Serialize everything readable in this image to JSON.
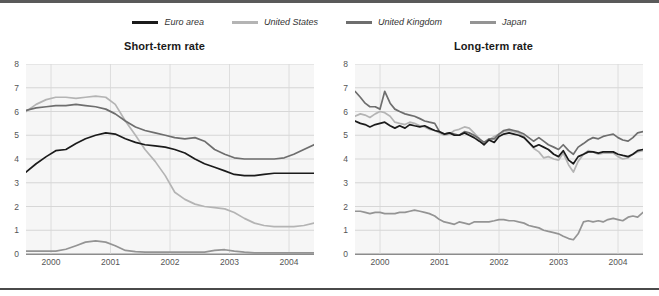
{
  "legend": {
    "items": [
      {
        "label": "Euro area",
        "color": "#1b1b1b",
        "icon": "line-swatch-icon"
      },
      {
        "label": "United States",
        "color": "#b4b4b4",
        "icon": "line-swatch-icon"
      },
      {
        "label": "United Kingdom",
        "color": "#6e6e6e",
        "icon": "line-swatch-icon"
      },
      {
        "label": "Japan",
        "color": "#949494",
        "icon": "line-swatch-icon"
      }
    ]
  },
  "panels": [
    {
      "title": "Short-term rate"
    },
    {
      "title": "Long-term rate"
    }
  ],
  "chart_data": [
    {
      "type": "line",
      "title": "Short-term rate",
      "xlabel": "",
      "ylabel": "",
      "xlim": [
        1999.58,
        2004.42
      ],
      "ylim": [
        0,
        8
      ],
      "yticks": [
        0,
        1,
        2,
        3,
        4,
        5,
        6,
        7,
        8
      ],
      "xticks": [
        2000,
        2001,
        2002,
        2003,
        2004
      ],
      "grid": "horizontal-and-vertical",
      "legend_position": "top-center-shared",
      "x": [
        1999.58,
        1999.75,
        1999.92,
        2000.08,
        2000.25,
        2000.42,
        2000.58,
        2000.75,
        2000.92,
        2001.08,
        2001.25,
        2001.42,
        2001.58,
        2001.75,
        2001.92,
        2002.08,
        2002.25,
        2002.42,
        2002.58,
        2002.75,
        2002.92,
        2003.08,
        2003.25,
        2003.42,
        2003.58,
        2003.75,
        2003.92,
        2004.08,
        2004.25,
        2004.42
      ],
      "series": [
        {
          "name": "Euro area",
          "color": "#1b1b1b",
          "values": [
            3.45,
            3.8,
            4.1,
            4.35,
            4.4,
            4.65,
            4.85,
            5.0,
            5.1,
            5.05,
            4.85,
            4.7,
            4.6,
            4.55,
            4.5,
            4.4,
            4.25,
            4.0,
            3.8,
            3.65,
            3.5,
            3.35,
            3.3,
            3.3,
            3.35,
            3.4,
            3.4,
            3.4,
            3.4,
            3.4
          ]
        },
        {
          "name": "United States",
          "color": "#b4b4b4",
          "values": [
            6.0,
            6.3,
            6.5,
            6.6,
            6.6,
            6.55,
            6.6,
            6.65,
            6.6,
            6.3,
            5.6,
            5.0,
            4.4,
            3.9,
            3.3,
            2.6,
            2.3,
            2.1,
            2.0,
            1.95,
            1.9,
            1.75,
            1.5,
            1.3,
            1.2,
            1.15,
            1.15,
            1.15,
            1.2,
            1.3
          ]
        },
        {
          "name": "United Kingdom",
          "color": "#6e6e6e",
          "values": [
            6.05,
            6.15,
            6.2,
            6.25,
            6.25,
            6.3,
            6.25,
            6.2,
            6.1,
            5.9,
            5.6,
            5.35,
            5.2,
            5.1,
            5.0,
            4.9,
            4.85,
            4.9,
            4.75,
            4.4,
            4.2,
            4.05,
            4.0,
            4.0,
            4.0,
            4.0,
            4.05,
            4.2,
            4.4,
            4.6
          ]
        },
        {
          "name": "Japan",
          "color": "#949494",
          "values": [
            0.12,
            0.12,
            0.12,
            0.12,
            0.2,
            0.35,
            0.5,
            0.55,
            0.5,
            0.35,
            0.15,
            0.1,
            0.08,
            0.08,
            0.08,
            0.08,
            0.08,
            0.08,
            0.08,
            0.15,
            0.18,
            0.12,
            0.08,
            0.05,
            0.05,
            0.05,
            0.05,
            0.05,
            0.05,
            0.05
          ]
        }
      ]
    },
    {
      "type": "line",
      "title": "Long-term rate",
      "xlabel": "",
      "ylabel": "",
      "xlim": [
        1999.58,
        2004.42
      ],
      "ylim": [
        0,
        8
      ],
      "yticks": [
        0,
        1,
        2,
        3,
        4,
        5,
        6,
        7,
        8
      ],
      "xticks": [
        2000,
        2001,
        2002,
        2003,
        2004
      ],
      "grid": "horizontal-and-vertical",
      "legend_position": "top-center-shared",
      "x": [
        1999.58,
        1999.67,
        1999.75,
        1999.83,
        1999.92,
        2000.0,
        2000.08,
        2000.17,
        2000.25,
        2000.33,
        2000.42,
        2000.5,
        2000.58,
        2000.67,
        2000.75,
        2000.83,
        2000.92,
        2001.0,
        2001.08,
        2001.17,
        2001.25,
        2001.33,
        2001.42,
        2001.5,
        2001.58,
        2001.67,
        2001.75,
        2001.83,
        2001.92,
        2002.0,
        2002.08,
        2002.17,
        2002.25,
        2002.33,
        2002.42,
        2002.5,
        2002.58,
        2002.67,
        2002.75,
        2002.83,
        2002.92,
        2003.0,
        2003.08,
        2003.17,
        2003.25,
        2003.33,
        2003.42,
        2003.5,
        2003.58,
        2003.67,
        2003.75,
        2003.83,
        2003.92,
        2004.0,
        2004.08,
        2004.17,
        2004.25,
        2004.33,
        2004.42
      ],
      "series": [
        {
          "name": "Euro area",
          "color": "#1b1b1b",
          "values": [
            5.6,
            5.5,
            5.45,
            5.35,
            5.45,
            5.5,
            5.55,
            5.4,
            5.3,
            5.4,
            5.3,
            5.45,
            5.4,
            5.35,
            5.4,
            5.3,
            5.2,
            5.15,
            5.05,
            5.1,
            5.0,
            5.0,
            5.1,
            5.0,
            4.9,
            4.75,
            4.6,
            4.8,
            4.7,
            4.95,
            5.05,
            5.1,
            5.05,
            5.0,
            4.9,
            4.7,
            4.5,
            4.6,
            4.5,
            4.4,
            4.2,
            4.1,
            4.35,
            3.95,
            3.8,
            4.1,
            4.2,
            4.3,
            4.3,
            4.25,
            4.3,
            4.3,
            4.3,
            4.2,
            4.15,
            4.1,
            4.2,
            4.35,
            4.4
          ]
        },
        {
          "name": "United States",
          "color": "#b4b4b4",
          "values": [
            5.8,
            5.9,
            5.85,
            5.75,
            5.9,
            6.0,
            5.95,
            5.8,
            5.55,
            5.5,
            5.45,
            5.55,
            5.5,
            5.4,
            5.35,
            5.25,
            5.2,
            5.1,
            5.0,
            5.05,
            5.2,
            5.25,
            5.35,
            5.3,
            5.1,
            4.85,
            4.6,
            4.8,
            4.95,
            5.05,
            5.15,
            5.2,
            5.15,
            5.1,
            4.95,
            4.7,
            4.45,
            4.3,
            4.05,
            4.1,
            4.0,
            3.95,
            4.25,
            3.75,
            3.45,
            3.9,
            4.2,
            4.35,
            4.3,
            4.2,
            4.25,
            4.25,
            4.25,
            4.1,
            4.0,
            4.05,
            4.2,
            4.3,
            4.35
          ]
        },
        {
          "name": "United Kingdom",
          "color": "#6e6e6e",
          "values": [
            6.85,
            6.6,
            6.35,
            6.2,
            6.2,
            6.1,
            6.85,
            6.35,
            6.1,
            6.0,
            5.9,
            5.85,
            5.8,
            5.7,
            5.6,
            5.55,
            5.5,
            5.15,
            5.05,
            5.1,
            5.05,
            5.0,
            5.15,
            5.1,
            5.0,
            4.85,
            4.7,
            4.85,
            4.85,
            5.05,
            5.2,
            5.25,
            5.2,
            5.15,
            5.05,
            4.9,
            4.75,
            4.9,
            4.75,
            4.6,
            4.5,
            4.4,
            4.6,
            4.35,
            4.2,
            4.5,
            4.65,
            4.8,
            4.9,
            4.85,
            4.95,
            5.0,
            5.05,
            4.9,
            4.8,
            4.75,
            4.9,
            5.1,
            5.15
          ]
        },
        {
          "name": "Japan",
          "color": "#949494",
          "values": [
            1.8,
            1.8,
            1.75,
            1.7,
            1.75,
            1.75,
            1.7,
            1.7,
            1.7,
            1.75,
            1.75,
            1.8,
            1.85,
            1.8,
            1.75,
            1.7,
            1.6,
            1.45,
            1.35,
            1.3,
            1.25,
            1.35,
            1.3,
            1.25,
            1.35,
            1.35,
            1.35,
            1.35,
            1.4,
            1.45,
            1.45,
            1.4,
            1.4,
            1.35,
            1.3,
            1.2,
            1.15,
            1.1,
            1.0,
            0.95,
            0.9,
            0.85,
            0.75,
            0.65,
            0.6,
            0.85,
            1.35,
            1.4,
            1.35,
            1.4,
            1.35,
            1.45,
            1.5,
            1.45,
            1.4,
            1.55,
            1.6,
            1.55,
            1.75
          ]
        }
      ]
    }
  ]
}
